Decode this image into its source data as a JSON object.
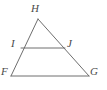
{
  "figure": {
    "kind": "geometry-diagram",
    "background_color": "#ffffff",
    "stroke_color": "#6e6e6e",
    "label_color": "#4a4a4a",
    "stroke_width": 1,
    "canvas": {
      "width": 107,
      "height": 90
    },
    "points": {
      "H": {
        "x": 38,
        "y": 19,
        "label": "H"
      },
      "F": {
        "x": 11,
        "y": 76,
        "label": "F"
      },
      "G": {
        "x": 89,
        "y": 76,
        "label": "G"
      },
      "I": {
        "x": 21,
        "y": 48,
        "label": "I"
      },
      "J": {
        "x": 65,
        "y": 48,
        "label": "J"
      }
    },
    "segments": [
      {
        "name": "HF",
        "from": "H",
        "to": "F"
      },
      {
        "name": "HG",
        "from": "H",
        "to": "G"
      },
      {
        "name": "FG",
        "from": "F",
        "to": "G"
      },
      {
        "name": "IJ",
        "from": "I",
        "to": "J"
      }
    ],
    "labels": {
      "H": "H",
      "I": "I",
      "J": "J",
      "F": "F",
      "G": "G"
    }
  }
}
